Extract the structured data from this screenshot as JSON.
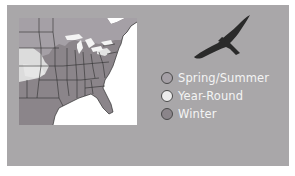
{
  "figure": {
    "map_region": "Eastern United States",
    "legend": {
      "items": [
        {
          "label": "Spring/Summer",
          "color": "#a5a0a6"
        },
        {
          "label": "Year-Round",
          "color": "#ececec"
        },
        {
          "label": "Winter",
          "color": "#8b858a"
        }
      ]
    },
    "icons": {
      "bird": "hawk-silhouette-icon"
    },
    "colors": {
      "panel_background": "#a9a7a9",
      "ocean": "#ffffff",
      "state_borders": "#2f2f2f",
      "bird": "#2a2a2a"
    }
  }
}
